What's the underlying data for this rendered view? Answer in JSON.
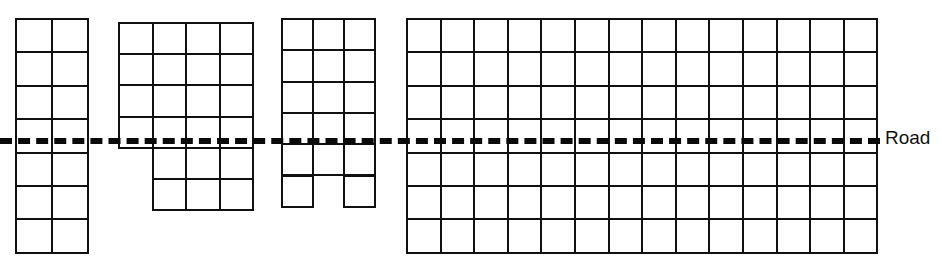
{
  "diagram": {
    "canvas": {
      "width": 940,
      "height": 266,
      "background": "#ffffff"
    },
    "line_color": "#111111",
    "road": {
      "label": "Road",
      "color": "#0a0a0a",
      "y": 138,
      "x_start": 0,
      "x_end": 880,
      "thickness": 6,
      "style": "dashed",
      "label_x": 885,
      "label_y": 128
    },
    "blocks": [
      {
        "name": "block-1",
        "x": 15,
        "y": 18,
        "cell_w": 36,
        "cell_h": 33.4,
        "columns": 2,
        "rows": 7,
        "road_row_index": 3,
        "cells": [
          {
            "col": 0,
            "row": 0
          },
          {
            "col": 1,
            "row": 0
          },
          {
            "col": 0,
            "row": 1
          },
          {
            "col": 1,
            "row": 1
          },
          {
            "col": 0,
            "row": 2
          },
          {
            "col": 1,
            "row": 2
          },
          {
            "col": 0,
            "row": 3
          },
          {
            "col": 1,
            "row": 3
          },
          {
            "col": 0,
            "row": 4
          },
          {
            "col": 1,
            "row": 4
          },
          {
            "col": 0,
            "row": 5
          },
          {
            "col": 1,
            "row": 5
          },
          {
            "col": 0,
            "row": 6
          },
          {
            "col": 1,
            "row": 6
          }
        ]
      },
      {
        "name": "block-2",
        "x": 118,
        "y": 22,
        "cell_w": 33.5,
        "cell_h": 31.2,
        "columns": 4,
        "rows": 6,
        "road_row_index": 4,
        "cells": [
          {
            "col": 0,
            "row": 0
          },
          {
            "col": 1,
            "row": 0
          },
          {
            "col": 2,
            "row": 0
          },
          {
            "col": 3,
            "row": 0
          },
          {
            "col": 0,
            "row": 1
          },
          {
            "col": 1,
            "row": 1
          },
          {
            "col": 2,
            "row": 1
          },
          {
            "col": 3,
            "row": 1
          },
          {
            "col": 0,
            "row": 2
          },
          {
            "col": 1,
            "row": 2
          },
          {
            "col": 2,
            "row": 2
          },
          {
            "col": 3,
            "row": 2
          },
          {
            "col": 0,
            "row": 3
          },
          {
            "col": 1,
            "row": 3
          },
          {
            "col": 2,
            "row": 3
          },
          {
            "col": 3,
            "row": 3
          },
          {
            "col": 1,
            "row": 4
          },
          {
            "col": 2,
            "row": 4
          },
          {
            "col": 3,
            "row": 4
          },
          {
            "col": 1,
            "row": 5
          },
          {
            "col": 2,
            "row": 5
          },
          {
            "col": 3,
            "row": 5
          }
        ]
      },
      {
        "name": "block-3",
        "x": 281,
        "y": 18,
        "cell_w": 31,
        "cell_h": 31.3,
        "columns": 3,
        "rows": 6,
        "road_row_index": 4,
        "cells": [
          {
            "col": 0,
            "row": 0
          },
          {
            "col": 1,
            "row": 0
          },
          {
            "col": 2,
            "row": 0
          },
          {
            "col": 0,
            "row": 1
          },
          {
            "col": 1,
            "row": 1
          },
          {
            "col": 2,
            "row": 1
          },
          {
            "col": 0,
            "row": 2
          },
          {
            "col": 1,
            "row": 2
          },
          {
            "col": 2,
            "row": 2
          },
          {
            "col": 0,
            "row": 3
          },
          {
            "col": 1,
            "row": 3
          },
          {
            "col": 2,
            "row": 3
          },
          {
            "col": 0,
            "row": 4
          },
          {
            "col": 1,
            "row": 4
          },
          {
            "col": 2,
            "row": 4
          },
          {
            "col": 0,
            "row": 5
          },
          {
            "col": 2,
            "row": 5
          }
        ]
      },
      {
        "name": "block-4",
        "x": 406,
        "y": 18,
        "cell_w": 33.6,
        "cell_h": 33.4,
        "columns": 14,
        "rows": 7,
        "road_row_index": 3,
        "cells": [
          {
            "col": 0,
            "row": 0
          },
          {
            "col": 1,
            "row": 0
          },
          {
            "col": 2,
            "row": 0
          },
          {
            "col": 3,
            "row": 0
          },
          {
            "col": 4,
            "row": 0
          },
          {
            "col": 5,
            "row": 0
          },
          {
            "col": 6,
            "row": 0
          },
          {
            "col": 7,
            "row": 0
          },
          {
            "col": 8,
            "row": 0
          },
          {
            "col": 9,
            "row": 0
          },
          {
            "col": 10,
            "row": 0
          },
          {
            "col": 11,
            "row": 0
          },
          {
            "col": 12,
            "row": 0
          },
          {
            "col": 13,
            "row": 0
          },
          {
            "col": 0,
            "row": 1
          },
          {
            "col": 1,
            "row": 1
          },
          {
            "col": 2,
            "row": 1
          },
          {
            "col": 3,
            "row": 1
          },
          {
            "col": 4,
            "row": 1
          },
          {
            "col": 5,
            "row": 1
          },
          {
            "col": 6,
            "row": 1
          },
          {
            "col": 7,
            "row": 1
          },
          {
            "col": 8,
            "row": 1
          },
          {
            "col": 9,
            "row": 1
          },
          {
            "col": 10,
            "row": 1
          },
          {
            "col": 11,
            "row": 1
          },
          {
            "col": 12,
            "row": 1
          },
          {
            "col": 13,
            "row": 1
          },
          {
            "col": 0,
            "row": 2
          },
          {
            "col": 1,
            "row": 2
          },
          {
            "col": 2,
            "row": 2
          },
          {
            "col": 3,
            "row": 2
          },
          {
            "col": 4,
            "row": 2
          },
          {
            "col": 5,
            "row": 2
          },
          {
            "col": 6,
            "row": 2
          },
          {
            "col": 7,
            "row": 2
          },
          {
            "col": 8,
            "row": 2
          },
          {
            "col": 9,
            "row": 2
          },
          {
            "col": 10,
            "row": 2
          },
          {
            "col": 11,
            "row": 2
          },
          {
            "col": 12,
            "row": 2
          },
          {
            "col": 13,
            "row": 2
          },
          {
            "col": 0,
            "row": 3
          },
          {
            "col": 1,
            "row": 3
          },
          {
            "col": 2,
            "row": 3
          },
          {
            "col": 3,
            "row": 3
          },
          {
            "col": 4,
            "row": 3
          },
          {
            "col": 5,
            "row": 3
          },
          {
            "col": 6,
            "row": 3
          },
          {
            "col": 7,
            "row": 3
          },
          {
            "col": 8,
            "row": 3
          },
          {
            "col": 9,
            "row": 3
          },
          {
            "col": 10,
            "row": 3
          },
          {
            "col": 11,
            "row": 3
          },
          {
            "col": 12,
            "row": 3
          },
          {
            "col": 13,
            "row": 3
          },
          {
            "col": 0,
            "row": 4
          },
          {
            "col": 1,
            "row": 4
          },
          {
            "col": 2,
            "row": 4
          },
          {
            "col": 3,
            "row": 4
          },
          {
            "col": 4,
            "row": 4
          },
          {
            "col": 5,
            "row": 4
          },
          {
            "col": 6,
            "row": 4
          },
          {
            "col": 7,
            "row": 4
          },
          {
            "col": 8,
            "row": 4
          },
          {
            "col": 9,
            "row": 4
          },
          {
            "col": 10,
            "row": 4
          },
          {
            "col": 11,
            "row": 4
          },
          {
            "col": 12,
            "row": 4
          },
          {
            "col": 13,
            "row": 4
          },
          {
            "col": 0,
            "row": 5
          },
          {
            "col": 1,
            "row": 5
          },
          {
            "col": 2,
            "row": 5
          },
          {
            "col": 3,
            "row": 5
          },
          {
            "col": 4,
            "row": 5
          },
          {
            "col": 5,
            "row": 5
          },
          {
            "col": 6,
            "row": 5
          },
          {
            "col": 7,
            "row": 5
          },
          {
            "col": 8,
            "row": 5
          },
          {
            "col": 9,
            "row": 5
          },
          {
            "col": 10,
            "row": 5
          },
          {
            "col": 11,
            "row": 5
          },
          {
            "col": 12,
            "row": 5
          },
          {
            "col": 13,
            "row": 5
          },
          {
            "col": 0,
            "row": 6
          },
          {
            "col": 1,
            "row": 6
          },
          {
            "col": 2,
            "row": 6
          },
          {
            "col": 3,
            "row": 6
          },
          {
            "col": 4,
            "row": 6
          },
          {
            "col": 5,
            "row": 6
          },
          {
            "col": 6,
            "row": 6
          },
          {
            "col": 7,
            "row": 6
          },
          {
            "col": 8,
            "row": 6
          },
          {
            "col": 9,
            "row": 6
          },
          {
            "col": 10,
            "row": 6
          },
          {
            "col": 11,
            "row": 6
          },
          {
            "col": 12,
            "row": 6
          },
          {
            "col": 13,
            "row": 6
          }
        ]
      }
    ]
  }
}
